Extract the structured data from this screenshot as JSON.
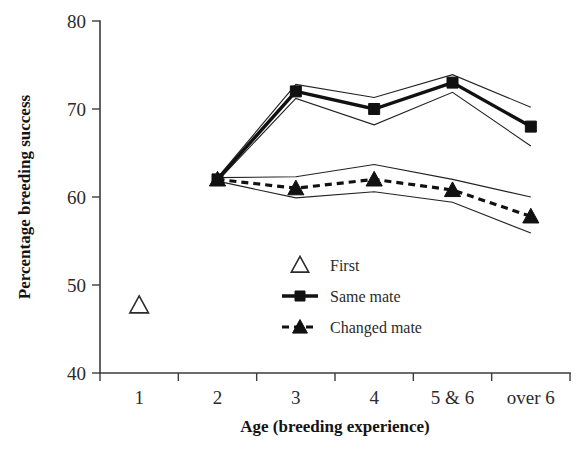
{
  "chart_data": {
    "type": "line",
    "title": "",
    "xlabel": "Age (breeding experience)",
    "ylabel": "Percentage breeding success",
    "categories": [
      "1",
      "2",
      "3",
      "4",
      "5 & 6",
      "over 6"
    ],
    "ylim": [
      40,
      80
    ],
    "yticks": [
      40,
      50,
      60,
      70,
      80
    ],
    "ytick_labels": [
      "40",
      "50",
      "60",
      "70",
      "80"
    ],
    "grid": false,
    "legend_position": "center",
    "series": [
      {
        "name": "First",
        "marker": "open-triangle",
        "line": "none",
        "x": [
          "1"
        ],
        "values": [
          47.7
        ]
      },
      {
        "name": "Same mate",
        "marker": "filled-square",
        "line": "solid",
        "x": [
          "2",
          "3",
          "4",
          "5 & 6",
          "over 6"
        ],
        "values": [
          62.0,
          72.0,
          70.0,
          73.0,
          68.0
        ],
        "upper": [
          62.2,
          72.8,
          71.3,
          73.9,
          70.2
        ],
        "lower": [
          61.8,
          71.2,
          68.2,
          71.9,
          65.8
        ]
      },
      {
        "name": "Changed mate",
        "marker": "filled-triangle",
        "line": "dashed",
        "x": [
          "2",
          "3",
          "4",
          "5 & 6",
          "over 6"
        ],
        "values": [
          62.0,
          61.0,
          62.0,
          60.8,
          57.8
        ],
        "upper": [
          62.2,
          62.3,
          63.7,
          62.0,
          60.0
        ],
        "lower": [
          61.8,
          59.9,
          60.6,
          59.4,
          55.9
        ]
      }
    ]
  },
  "legend": {
    "items": [
      {
        "label": "First",
        "symbol": "open-triangle",
        "line": "none"
      },
      {
        "label": "Same mate",
        "symbol": "filled-square",
        "line": "solid"
      },
      {
        "label": "Changed mate",
        "symbol": "filled-triangle",
        "line": "dashed"
      }
    ]
  },
  "colors": {
    "ink": "#111111",
    "axis": "#3b3b3b",
    "background": "#ffffff"
  }
}
